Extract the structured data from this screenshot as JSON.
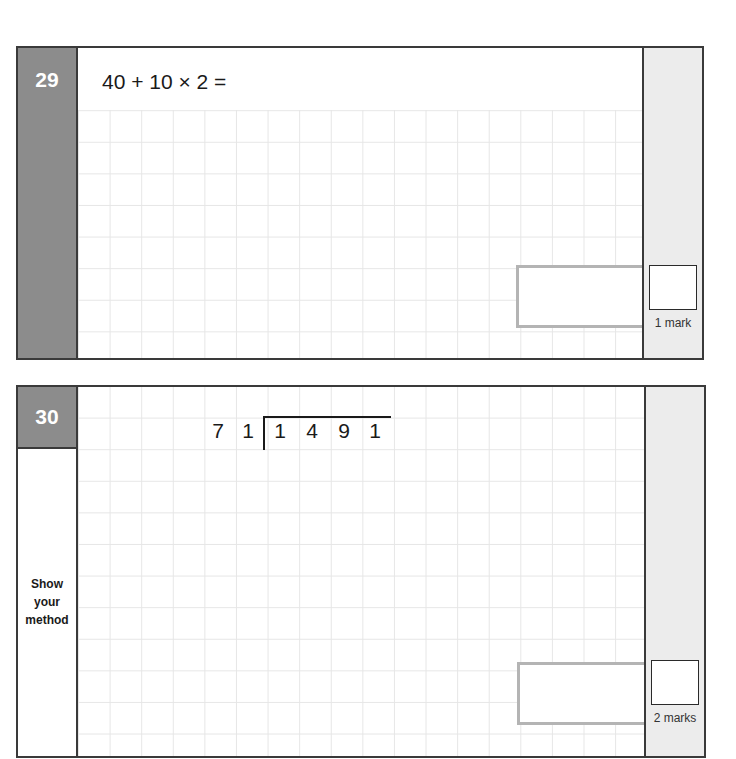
{
  "questions": [
    {
      "number": "29",
      "prompt": "40 + 10 × 2 =",
      "answer_box_value": "",
      "mark_box_value": "",
      "marks_label": "1 mark"
    },
    {
      "number": "30",
      "divisor": [
        "7",
        "1"
      ],
      "dividend": [
        "1",
        "4",
        "9",
        "1"
      ],
      "method_label": [
        "Show",
        "your",
        "method"
      ],
      "answer_box_value": "",
      "mark_box_value": "",
      "marks_label": "2 marks"
    }
  ],
  "colors": {
    "number_tab": "#8c8c8c",
    "mark_column": "#ececec",
    "grid_line": "#e6e6e6",
    "answer_box_border": "#b4b4b4",
    "border": "#3a3a3a"
  }
}
